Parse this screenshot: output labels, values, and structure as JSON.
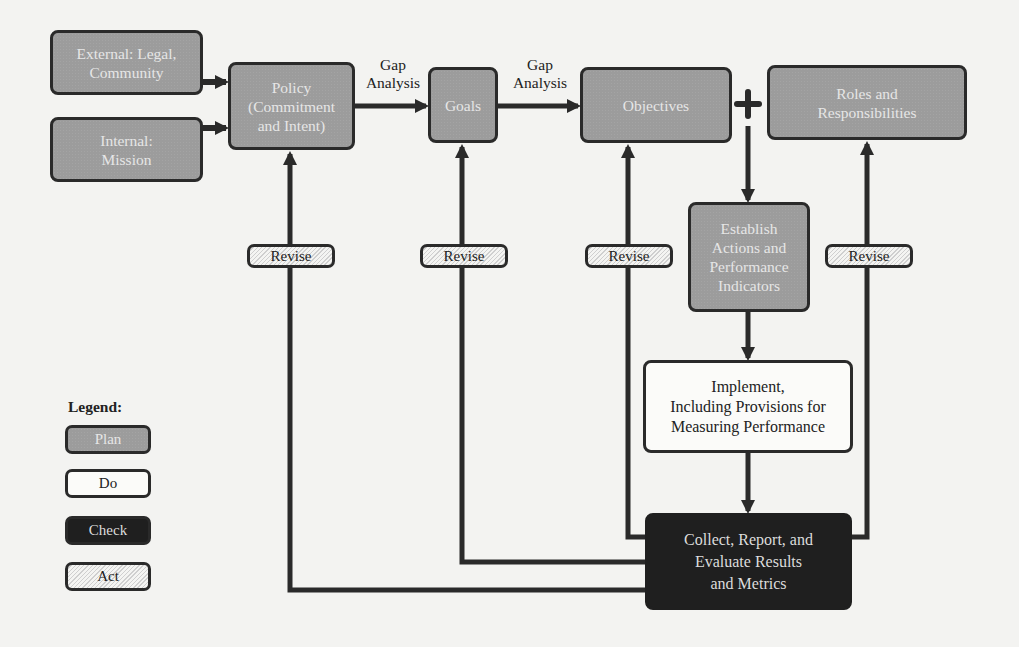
{
  "diagram": {
    "nodes": {
      "external": {
        "label": "External: Legal, Community",
        "line1": "External: Legal,",
        "line2": "Community",
        "phase": "plan"
      },
      "internal": {
        "label": "Internal: Mission",
        "line1": "Internal:",
        "line2": "Mission",
        "phase": "plan"
      },
      "policy": {
        "label": "Policy (Commitment and Intent)",
        "line1": "Policy",
        "line2": "(Commitment",
        "line3": "and Intent)",
        "phase": "plan"
      },
      "goals": {
        "label": "Goals",
        "phase": "plan"
      },
      "objectives": {
        "label": "Objectives",
        "phase": "plan"
      },
      "roles": {
        "label": "Roles and Responsibilities",
        "line1": "Roles and",
        "line2": "Responsibilities",
        "phase": "plan"
      },
      "establish": {
        "label": "Establish Actions and Performance Indicators",
        "line1": "Establish",
        "line2": "Actions and",
        "line3": "Performance",
        "line4": "Indicators",
        "phase": "plan"
      },
      "implement": {
        "label": "Implement, Including Provisions for Measuring Performance",
        "line1": "Implement,",
        "line2": "Including Provisions for",
        "line3": "Measuring Performance",
        "phase": "do"
      },
      "collect": {
        "label": "Collect, Report, and Evaluate Results and Metrics",
        "line1": "Collect, Report, and",
        "line2": "Evaluate Results",
        "line3": "and Metrics",
        "phase": "check"
      }
    },
    "edge_labels": {
      "policy_to_goals": {
        "line1": "Gap",
        "line2": "Analysis"
      },
      "goals_to_objectives": {
        "line1": "Gap",
        "line2": "Analysis"
      }
    },
    "plus_symbol": "+",
    "revise_labels": [
      "Revise",
      "Revise",
      "Revise",
      "Revise"
    ],
    "edges": [
      {
        "from": "external",
        "to": "policy"
      },
      {
        "from": "internal",
        "to": "policy"
      },
      {
        "from": "policy",
        "to": "goals",
        "label": "Gap Analysis"
      },
      {
        "from": "goals",
        "to": "objectives",
        "label": "Gap Analysis"
      },
      {
        "from": "objectives+roles",
        "to": "establish"
      },
      {
        "from": "establish",
        "to": "implement"
      },
      {
        "from": "implement",
        "to": "collect"
      },
      {
        "from": "collect",
        "to": "policy",
        "label": "Revise"
      },
      {
        "from": "collect",
        "to": "goals",
        "label": "Revise"
      },
      {
        "from": "collect",
        "to": "objectives",
        "label": "Revise"
      },
      {
        "from": "collect",
        "to": "roles",
        "label": "Revise"
      }
    ]
  },
  "legend": {
    "title": "Legend:",
    "items": [
      {
        "label": "Plan",
        "style": "plan"
      },
      {
        "label": "Do",
        "style": "do"
      },
      {
        "label": "Check",
        "style": "check"
      },
      {
        "label": "Act",
        "style": "act"
      }
    ]
  },
  "colors": {
    "plan_fill": "#9c9c9c",
    "do_fill": "#fbfbf9",
    "check_fill": "#1f1f1f",
    "act_fill": "hatched",
    "line": "#2a2a2a",
    "page": "#f3f3f1"
  }
}
